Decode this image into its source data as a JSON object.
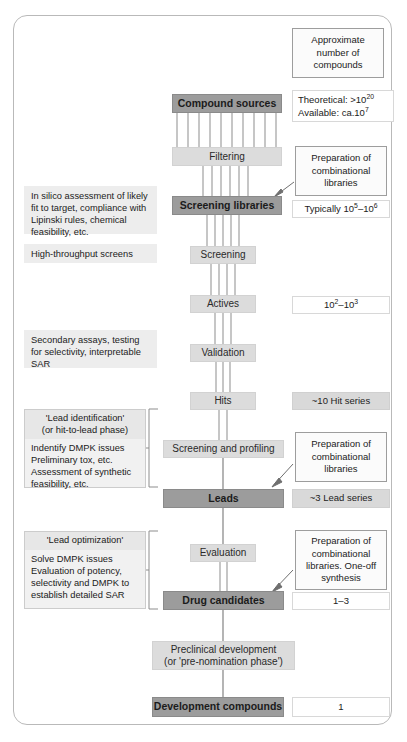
{
  "diagram": {
    "legend_header": "Approximate number of compounds"
  },
  "flow": {
    "compound_sources": "Compound sources",
    "filtering": "Filtering",
    "screening_libraries": "Screening libraries",
    "screening": "Screening",
    "actives": "Actives",
    "validation": "Validation",
    "hits": "Hits",
    "screening_and_profiling": "Screening and profiling",
    "leads": "Leads",
    "evaluation": "Evaluation",
    "drug_candidates": "Drug candidates",
    "preclinical": "Preclinical development\n(or 'pre-nomination phase')",
    "preclinical_l1": "Preclinical development",
    "preclinical_l2": "(or 'pre-nomination phase')",
    "development_compounds": "Development compounds"
  },
  "left_notes": {
    "in_silico": "In silico assessment of likely fit to target, compliance with Lipinski rules, chemical feasibility, etc.",
    "hts": "High-throughput screens",
    "secondary": "Secondary assays, testing for selectivity, interpretable SAR"
  },
  "left_groups": [
    {
      "header_l1": "'Lead identification'",
      "header_l2": "(or hit-to-lead phase)",
      "body_l1": "Indentify DMPK issues",
      "body_l2": "Preliminary tox, etc.",
      "body_l3": "Assessment of synthetic",
      "body_l4": "feasibility, etc."
    },
    {
      "header_l1": "'Lead optimization'",
      "header_l2": "",
      "body_l1": "Solve DMPK issues",
      "body_l2": "Evaluation of potency,",
      "body_l3": "selectivity and DMPK to",
      "body_l4": "establish detailed SAR"
    }
  ],
  "right_column": {
    "header_l1": "Approximate",
    "header_l2": "number of",
    "header_l3": "compounds",
    "theoretical_label": "Theoretical: >10",
    "theoretical_exp": "20",
    "available_label": "Available: ca.10",
    "available_exp": "7",
    "prep_libraries_l1": "Preparation of",
    "prep_libraries_l2": "combinational",
    "prep_libraries_l3": "libraries",
    "typically_pre": "Typically 10",
    "typically_exp1": "5",
    "typically_mid": "–10",
    "typically_exp2": "6",
    "actives_pre": "10",
    "actives_exp1": "2",
    "actives_mid": "–10",
    "actives_exp2": "3",
    "hit_series": "~10 Hit series",
    "prep_libraries2_l1": "Preparation of",
    "prep_libraries2_l2": "combinational",
    "prep_libraries2_l3": "libraries",
    "lead_series": "~3 Lead series",
    "prep_libraries3_l1": "Preparation of",
    "prep_libraries3_l2": "combinational",
    "prep_libraries3_l3": "libraries. One-off",
    "prep_libraries3_l4": "synthesis",
    "candidates_count": "1–3",
    "development_count": "1"
  }
}
